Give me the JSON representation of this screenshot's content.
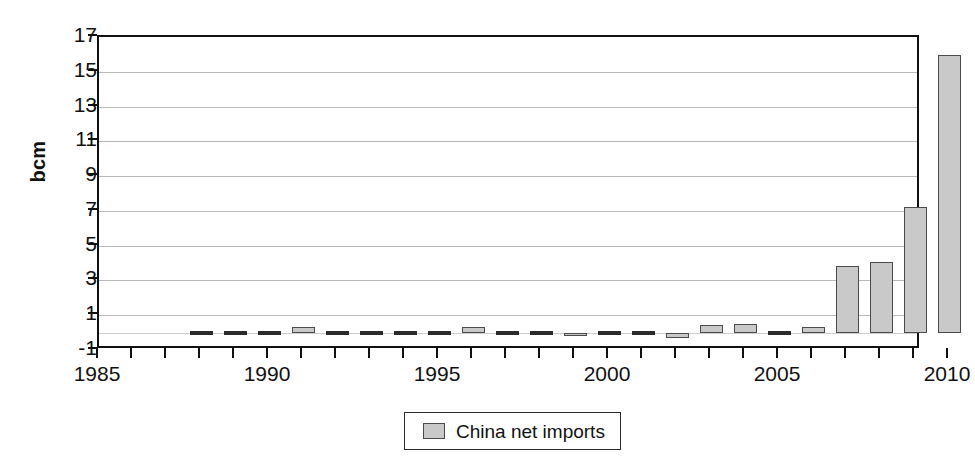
{
  "chart_data": {
    "type": "bar",
    "title": "",
    "subtitle": "",
    "xlabel": "",
    "ylabel": "bcm",
    "grid": true,
    "legend_position": "bottom-center",
    "xlim": [
      1985,
      2010.5
    ],
    "ylim": [
      -1,
      17
    ],
    "ytick_step": 2,
    "yticks": [
      -1,
      1,
      3,
      5,
      7,
      9,
      11,
      13,
      15,
      17
    ],
    "ytick_labels": [
      "-1",
      "1",
      "3",
      "5",
      "7",
      "9",
      "11",
      "13",
      "15",
      "17"
    ],
    "xticks": [
      1985,
      1986,
      1987,
      1988,
      1989,
      1990,
      1991,
      1992,
      1993,
      1994,
      1995,
      1996,
      1997,
      1998,
      1999,
      2000,
      2001,
      2002,
      2003,
      2004,
      2005,
      2006,
      2007,
      2008,
      2009,
      2010
    ],
    "xtick_labels_shown": [
      "1985",
      "1990",
      "1995",
      "2000",
      "2005",
      "2010"
    ],
    "xtick_label_years": [
      1985,
      1990,
      1995,
      2000,
      2005,
      2010
    ],
    "series": [
      {
        "name": "China net imports",
        "color": "#c9c9c9",
        "edge_color": "#4a4a4a",
        "x": [
          1988,
          1989,
          1990,
          1991,
          1992,
          1993,
          1994,
          1995,
          1996,
          1997,
          1998,
          1999,
          2000,
          2001,
          2002,
          2003,
          2004,
          2005,
          2006,
          2007,
          2008,
          2009,
          2010
        ],
        "values": [
          0.0,
          0.0,
          0.0,
          0.35,
          0.0,
          0.0,
          -0.12,
          -0.12,
          0.35,
          0.0,
          0.0,
          -0.2,
          0.15,
          0.0,
          -0.3,
          0.45,
          0.5,
          0.0,
          0.35,
          3.85,
          4.05,
          7.2,
          15.95
        ]
      }
    ],
    "legend": [
      {
        "label": "China net imports",
        "color": "#c9c9c9",
        "edge_color": "#4a4a4a"
      }
    ]
  },
  "colors": {
    "bar_fill": "#c9c9c9",
    "bar_edge": "#4a4a4a",
    "axis": "#111111",
    "gridline": "#b9b9b9",
    "background": "#ffffff"
  }
}
